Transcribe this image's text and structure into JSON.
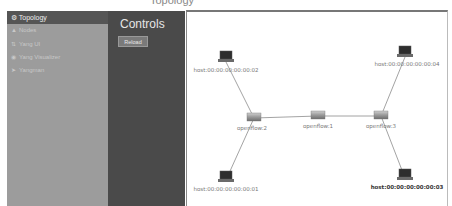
{
  "window": {
    "top_text": "Topology"
  },
  "sidebar": {
    "header": {
      "icon": "topology-icon",
      "label": "Topology"
    },
    "items": [
      {
        "icon": "nodes-icon",
        "label": "Nodes"
      },
      {
        "icon": "yang-ui-icon",
        "label": "Yang UI"
      },
      {
        "icon": "eye-icon",
        "label": "Yang Visualizer"
      },
      {
        "icon": "yangman-icon",
        "label": "Yangman"
      }
    ]
  },
  "controls": {
    "title": "Controls",
    "reload_label": "Reload"
  },
  "topology": {
    "colors": {
      "link": "#888888",
      "switch": "#8a8a8a",
      "host": "#333333"
    },
    "nodes": [
      {
        "id": "host:00:00:00:00:00:02",
        "type": "host",
        "x": 226,
        "y": 60,
        "selected": false
      },
      {
        "id": "host:00:00:00:00:00:04",
        "type": "host",
        "x": 405,
        "y": 55,
        "selected": false
      },
      {
        "id": "openflow:2",
        "type": "switch",
        "x": 254,
        "y": 118,
        "selected": false
      },
      {
        "id": "openflow:1",
        "type": "switch",
        "x": 318,
        "y": 116,
        "selected": false
      },
      {
        "id": "openflow:3",
        "type": "switch",
        "x": 381,
        "y": 116,
        "selected": false
      },
      {
        "id": "host:00:00:00:00:00:01",
        "type": "host",
        "x": 226,
        "y": 180,
        "selected": false
      },
      {
        "id": "host:00:00:00:00:00:03",
        "type": "host",
        "x": 405,
        "y": 178,
        "selected": true
      }
    ],
    "links": [
      [
        "host:00:00:00:00:00:02",
        "openflow:2"
      ],
      [
        "openflow:2",
        "host:00:00:00:00:00:01"
      ],
      [
        "openflow:2",
        "openflow:1"
      ],
      [
        "openflow:1",
        "openflow:3"
      ],
      [
        "openflow:3",
        "host:00:00:00:00:00:04"
      ],
      [
        "openflow:3",
        "host:00:00:00:00:00:03"
      ]
    ]
  }
}
